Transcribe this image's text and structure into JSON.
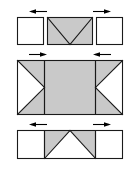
{
  "diagram": {
    "canvas": {
      "width": 140,
      "height": 176
    },
    "colors": {
      "panel_gray": "#c9c9c9",
      "panel_white": "#ffffff",
      "outline": "#1a1a1a",
      "arrow": "#000000",
      "background": "#ffffff"
    },
    "panels": [
      {
        "id": "top-panel",
        "name": "top-panel",
        "label": "Top configuration - separated panels",
        "layout": "three-separate-boxes",
        "boxes": [
          {
            "name": "top-left-box",
            "fill": "white",
            "pattern": "plain"
          },
          {
            "name": "top-center-box",
            "fill": "gray",
            "pattern": "v-fold"
          },
          {
            "name": "top-right-box",
            "fill": "white",
            "pattern": "plain"
          }
        ],
        "arrows": [
          {
            "name": "top-left-arrow",
            "direction": "left",
            "position": "above-center-left"
          },
          {
            "name": "top-right-arrow",
            "direction": "right",
            "position": "above-center-right"
          }
        ]
      },
      {
        "id": "middle-panel",
        "name": "middle-panel",
        "label": "Middle configuration - continuous panel, inward notches",
        "layout": "single-continuous-rectangle",
        "boxes": [
          {
            "name": "middle-left-section",
            "fill": "gray",
            "pattern": "right-pointing-white-triangle"
          },
          {
            "name": "middle-center-section",
            "fill": "gray",
            "pattern": "plain"
          },
          {
            "name": "middle-right-section",
            "fill": "gray",
            "pattern": "left-pointing-white-triangle"
          }
        ],
        "arrows": [
          {
            "name": "middle-left-arrow",
            "direction": "right",
            "position": "above-left-section"
          },
          {
            "name": "middle-right-arrow",
            "direction": "left",
            "position": "above-right-section"
          }
        ]
      },
      {
        "id": "bottom-panel",
        "name": "bottom-panel",
        "label": "Bottom configuration - continuous panel, peak fold",
        "layout": "single-continuous-rectangle",
        "boxes": [
          {
            "name": "bottom-left-section",
            "fill": "white",
            "pattern": "plain"
          },
          {
            "name": "bottom-center-section",
            "fill": "gray",
            "pattern": "peak-fold"
          },
          {
            "name": "bottom-right-section",
            "fill": "white",
            "pattern": "plain"
          }
        ],
        "arrows": [
          {
            "name": "bottom-left-arrow",
            "direction": "left",
            "position": "above-center-left"
          },
          {
            "name": "bottom-right-arrow",
            "direction": "right",
            "position": "above-center-right"
          }
        ]
      }
    ]
  }
}
